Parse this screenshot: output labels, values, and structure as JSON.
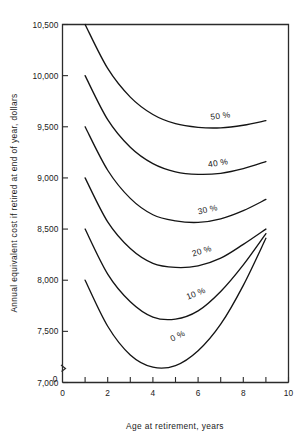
{
  "chart_data": {
    "type": "line",
    "title": "",
    "subtitle": "",
    "xlabel": "Age at retirement, years",
    "ylabel": "Annual equivalent cost if retired at end of year, dollars",
    "xlim": [
      0,
      10
    ],
    "ylim": [
      7000,
      10500
    ],
    "grid": false,
    "legend_position": "inline-curve-labels",
    "x_ticks": [
      0,
      1,
      2,
      3,
      4,
      5,
      6,
      7,
      8,
      9,
      10
    ],
    "x_tick_labels": [
      "0",
      "",
      "2",
      "",
      "4",
      "",
      "6",
      "",
      "8",
      "",
      "10"
    ],
    "x_major_labels": [
      "0",
      "2",
      "4",
      "6",
      "8",
      "10"
    ],
    "y_ticks": [
      7000,
      7500,
      8000,
      8500,
      9000,
      9500,
      10000,
      10500
    ],
    "y_tick_labels": [
      "7,000",
      "7,500",
      "8,000",
      "8,500",
      "9,000",
      "9,500",
      "10,000",
      "10,500"
    ],
    "axis_break_label": "0",
    "axis_break": true,
    "x": [
      1,
      2,
      3,
      4,
      5,
      6,
      7,
      8,
      9
    ],
    "series": [
      {
        "name": "0 %",
        "label": "0 %",
        "values": [
          8000,
          7550,
          7270,
          7150,
          7165,
          7310,
          7570,
          7950,
          8410
        ],
        "label_x": 5.15,
        "label_y": 7430,
        "label_rotation": -26
      },
      {
        "name": "10 %",
        "label": "10 %",
        "values": [
          8500,
          8060,
          7790,
          7640,
          7620,
          7700,
          7890,
          8150,
          8455
        ],
        "label_x": 5.95,
        "label_y": 7845,
        "label_rotation": -22
      },
      {
        "name": "20 %",
        "label": "20 %",
        "values": [
          9000,
          8570,
          8310,
          8165,
          8125,
          8140,
          8215,
          8350,
          8500
        ],
        "label_x": 6.2,
        "label_y": 8260,
        "label_rotation": -17
      },
      {
        "name": "30 %",
        "label": "30 %",
        "values": [
          9500,
          9075,
          8800,
          8640,
          8580,
          8565,
          8600,
          8680,
          8790
        ],
        "label_x": 6.45,
        "label_y": 8665,
        "label_rotation": -13
      },
      {
        "name": "40 %",
        "label": "40 %",
        "values": [
          10000,
          9570,
          9300,
          9140,
          9060,
          9035,
          9045,
          9090,
          9160
        ],
        "label_x": 6.9,
        "label_y": 9120,
        "label_rotation": -9
      },
      {
        "name": "50 %",
        "label": "50 %",
        "values": [
          10500,
          10070,
          9790,
          9620,
          9530,
          9495,
          9490,
          9515,
          9560
        ],
        "label_x": 7.0,
        "label_y": 9580,
        "label_rotation": -7
      }
    ]
  }
}
